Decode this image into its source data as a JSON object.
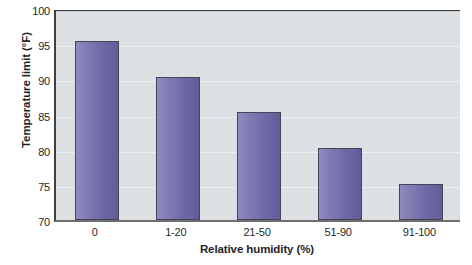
{
  "chart_data": {
    "type": "bar",
    "title": "",
    "xlabel": "Relative humidity (%)",
    "ylabel": "Temperature limit (°F)",
    "categories": [
      "0",
      "1-20",
      "21-50",
      "51-90",
      "91-100"
    ],
    "values": [
      95.4,
      90.3,
      85.3,
      80.2,
      75.1
    ],
    "series": [
      {
        "name": "Temperature limit",
        "values": [
          95.4,
          90.3,
          85.3,
          80.2,
          75.1
        ]
      }
    ],
    "ylim": [
      70,
      100
    ],
    "ytick_labels": [
      "70",
      "75",
      "80",
      "85",
      "90",
      "95",
      "100"
    ],
    "yticks": [
      70,
      75,
      80,
      85,
      90,
      95,
      100
    ],
    "grid": true,
    "grid_axis": "y",
    "legend": false,
    "legend_position": "none",
    "bar_color": "#6f6bab",
    "bar_border_color": "#3e3d55",
    "plot_background": "#dbdfe2",
    "axis_color": "#3a3a3a",
    "gridline_color": "#eceef0",
    "text_color": "#1a1a1a"
  }
}
